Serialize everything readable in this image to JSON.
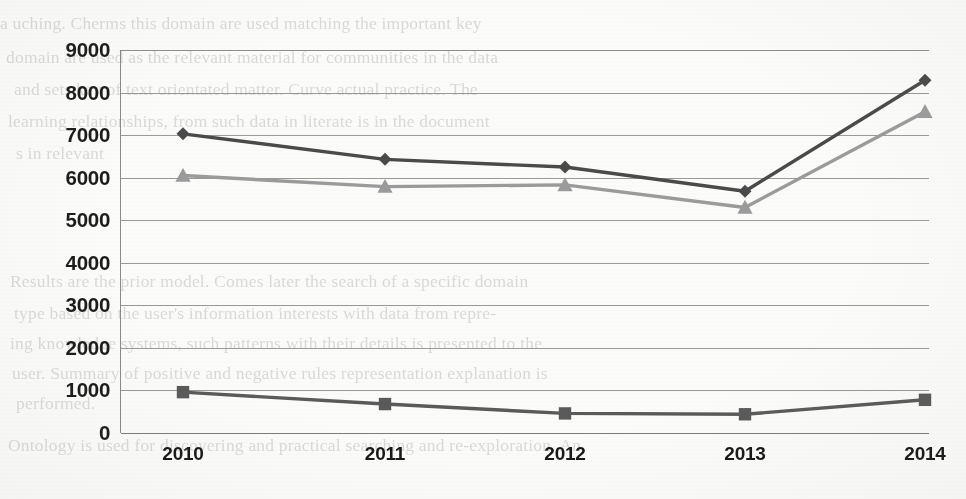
{
  "chart_data": {
    "type": "line",
    "title": "",
    "subtitle": "",
    "xlabel": "",
    "ylabel": "",
    "categories": [
      "2010",
      "2011",
      "2012",
      "2013",
      "2014"
    ],
    "ylim": [
      0,
      9000
    ],
    "ytick_values": [
      9000,
      8000,
      7000,
      6000,
      5000,
      4000,
      3000,
      2000,
      1000,
      0
    ],
    "ytick_labels": [
      "9000",
      "8000",
      "7000",
      "6000",
      "5000",
      "4000",
      "3000",
      "2000",
      "1000",
      "0"
    ],
    "grid": true,
    "legend": "none",
    "series": [
      {
        "name": "series-1",
        "marker": "diamond",
        "color": "#4a4a4a",
        "values": [
          7030,
          6430,
          6250,
          5680,
          8290
        ]
      },
      {
        "name": "series-2",
        "marker": "triangle",
        "color": "#9b9b9b",
        "values": [
          6050,
          5790,
          5830,
          5300,
          7550
        ]
      },
      {
        "name": "series-3",
        "marker": "square",
        "color": "#5a5a5a",
        "values": [
          960,
          680,
          460,
          440,
          780
        ]
      }
    ]
  },
  "colors": {
    "background": "#fbfbf9",
    "gridline": "#9a9a97",
    "axis": "#7c7c7a",
    "tick_text": "#1c1c1c",
    "series_dark": "#4a4a4a",
    "series_gray": "#9b9b9b",
    "series_bottom": "#5a5a5a"
  },
  "background_text": {
    "note": "faint show-through text from the reverse of the scanned page",
    "lines": [
      {
        "x": 0,
        "y": 10,
        "text": "a uching. Cherms this domain are used matching the important key"
      },
      {
        "x": 6,
        "y": 44,
        "text": "domain are used as the relevant material for communities in the data"
      },
      {
        "x": 14,
        "y": 76,
        "text": "and sets key of text orientated matter. Curve actual practice. The"
      },
      {
        "x": 8,
        "y": 108,
        "text": "learning relationships, from such data in literate is in the document"
      },
      {
        "x": 16,
        "y": 140,
        "text": "s in relevant"
      },
      {
        "x": 10,
        "y": 268,
        "text": "Results are the prior model. Comes later the search of a specific domain"
      },
      {
        "x": 14,
        "y": 300,
        "text": "type based on the user's information interests with data from    repre-"
      },
      {
        "x": 10,
        "y": 330,
        "text": "ing knowledge systems, such patterns with their details is presented to the"
      },
      {
        "x": 12,
        "y": 360,
        "text": "user. Summary of positive and negative rules representation explanation is"
      },
      {
        "x": 16,
        "y": 390,
        "text": "performed."
      },
      {
        "x": 8,
        "y": 432,
        "text": "Ontology is used for discovering and practical searching and re-exploration. An"
      }
    ]
  }
}
